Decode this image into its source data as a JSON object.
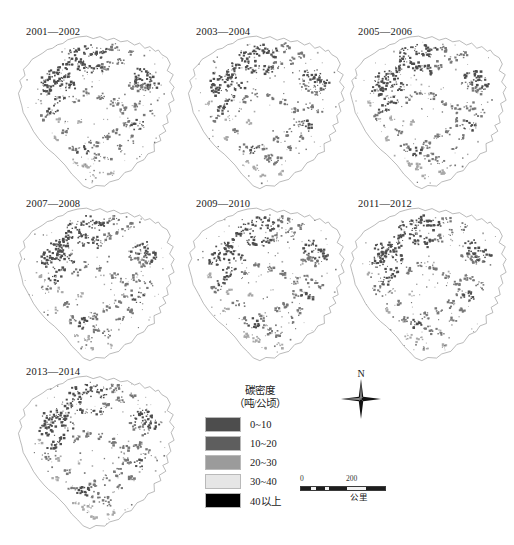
{
  "figure": {
    "background": "#ffffff",
    "panels": [
      {
        "label": "2001—2002",
        "left": 8,
        "top": 18
      },
      {
        "label": "2003—2004",
        "left": 178,
        "top": 18
      },
      {
        "label": "2005—2006",
        "left": 340,
        "top": 18
      },
      {
        "label": "2007—2008",
        "left": 8,
        "top": 190
      },
      {
        "label": "2009—2010",
        "left": 178,
        "top": 190
      },
      {
        "label": "2011—2012",
        "left": 340,
        "top": 190
      },
      {
        "label": "2013—2014",
        "left": 8,
        "top": 358
      }
    ]
  },
  "legend": {
    "title_line1": "碳密度",
    "title_line2": "（吨/公顷）",
    "items": [
      {
        "label": "0~10",
        "color": "#4d4d4d"
      },
      {
        "label": "10~20",
        "color": "#5e5e5e"
      },
      {
        "label": "20~30",
        "color": "#9b9b9b"
      },
      {
        "label": "30~40",
        "color": "#e6e6e6"
      },
      {
        "label": "40以上",
        "color": "#000000"
      }
    ]
  },
  "compass": {
    "north_label": "N"
  },
  "scalebar": {
    "tick_min": "0",
    "tick_max": "200",
    "unit": "公里"
  },
  "map_colors": {
    "outline": "#8c8c8c",
    "patch_dark": "#4d4d4d",
    "patch_mid": "#777777",
    "patch_light": "#a8a8a8"
  }
}
